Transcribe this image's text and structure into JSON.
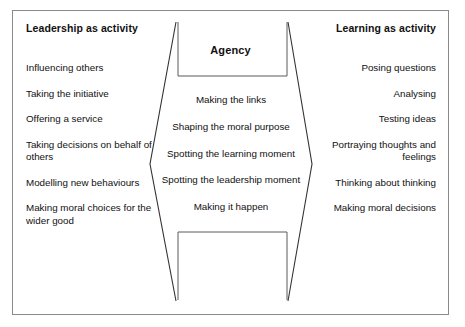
{
  "diagram": {
    "frame_color": "#8a8a8a",
    "line_color": "#333333",
    "text_color": "#111111"
  },
  "left_column": {
    "header": "Leadership as activity",
    "items": [
      "Influencing others",
      "Taking the initiative",
      "Offering a service",
      "Taking decisions on behalf of others",
      "Modelling new behaviours",
      "Making moral choices for the wider good"
    ]
  },
  "right_column": {
    "header": "Learning as activity",
    "items": [
      "Posing questions",
      "Analysing",
      "Testing ideas",
      "Portraying thoughts and feelings",
      "Thinking about thinking",
      "Making moral decisions"
    ]
  },
  "center": {
    "title": "Agency",
    "items": [
      "Making the links",
      "Shaping the moral purpose",
      "Spotting the learning moment",
      "Spotting the leadership moment",
      "Making it happen"
    ]
  }
}
